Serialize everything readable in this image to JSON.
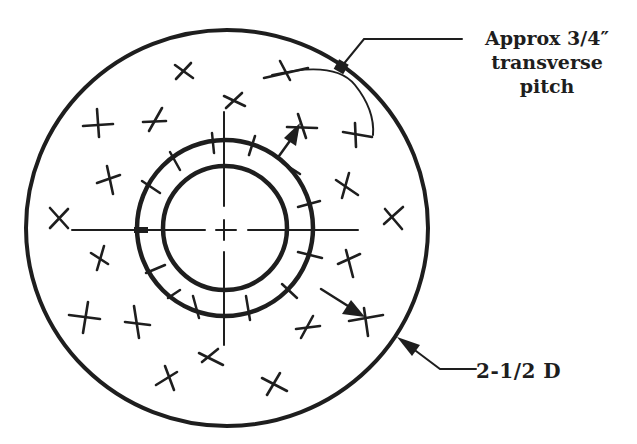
{
  "diagram": {
    "title": "",
    "colors": {
      "ink": "#1e1e1e",
      "background": "#ffffff"
    },
    "labels": {
      "pitch": {
        "line1": "Approx 3/4″",
        "line2": "transverse",
        "line3": "pitch"
      },
      "diameter": "2-1/2 D"
    },
    "geometry": {
      "center": [
        226,
        228
      ],
      "outer_circle_radius": 200,
      "tube_ring_radius": 88,
      "bore_circle_radius": 62
    },
    "nodes": [
      {
        "id": "outer-circle",
        "label": "2-1/2 D"
      },
      {
        "id": "tube-ring",
        "label": ""
      },
      {
        "id": "bore-circle",
        "label": ""
      },
      {
        "id": "pitch-arc",
        "label": "Approx 3/4″ transverse pitch"
      }
    ],
    "edges": [
      {
        "from": "pitch-label",
        "to": "outer-circle",
        "type": "leader"
      },
      {
        "from": "diameter-label",
        "to": "outer-circle",
        "type": "arrow-leader"
      },
      {
        "from": "tube-ring",
        "to": "cross-upper-right",
        "type": "arrow"
      },
      {
        "from": "tube-ring-gap",
        "to": "cross-lower-right",
        "type": "arrow"
      }
    ],
    "tick_count_on_ring": 18,
    "cross_marks": [
      [
        184,
        71
      ],
      [
        285,
        72
      ],
      [
        234,
        101
      ],
      [
        97,
        125
      ],
      [
        153,
        122
      ],
      [
        300,
        127
      ],
      [
        355,
        137
      ],
      [
        108,
        180
      ],
      [
        345,
        188
      ],
      [
        60,
        218
      ],
      [
        395,
        218
      ],
      [
        101,
        258
      ],
      [
        350,
        262
      ],
      [
        85,
        318
      ],
      [
        136,
        322
      ],
      [
        366,
        320
      ],
      [
        310,
        327
      ],
      [
        210,
        355
      ],
      [
        170,
        378
      ],
      [
        272,
        384
      ]
    ]
  }
}
